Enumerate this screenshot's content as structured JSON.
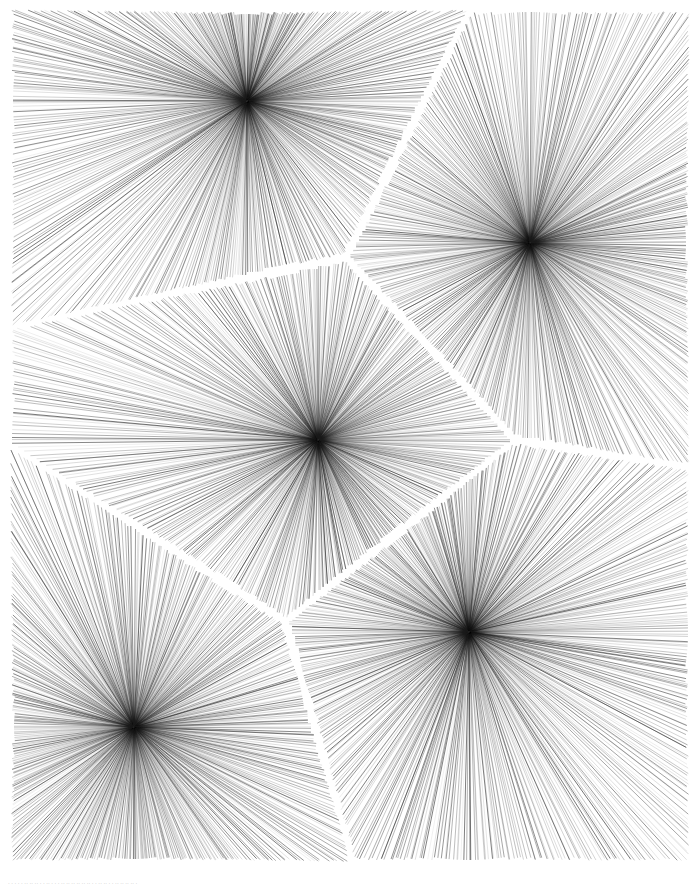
{
  "artwork": {
    "title": "Voronoi Radial Burst Field",
    "medium": "generative line drawing",
    "background_color": "#ffffff",
    "ink_color": "#1a1a1a",
    "margin_px": 9,
    "canvas": {
      "width": 700,
      "height": 872
    },
    "line_style": {
      "stroke_width": 0.45,
      "min_opacity": 0.18,
      "max_opacity": 0.95
    },
    "cells": [
      {
        "name": "cell-top-left",
        "center_x": 247,
        "center_y": 101,
        "rays": 520,
        "seed": 11
      },
      {
        "name": "cell-top-right",
        "center_x": 530,
        "center_y": 243,
        "rays": 520,
        "seed": 23
      },
      {
        "name": "cell-center",
        "center_x": 318,
        "center_y": 440,
        "rays": 520,
        "seed": 37
      },
      {
        "name": "cell-bottom-left",
        "center_x": 134,
        "center_y": 727,
        "rays": 520,
        "seed": 53
      },
      {
        "name": "cell-bottom-right",
        "center_x": 469,
        "center_y": 632,
        "rays": 520,
        "seed": 71
      }
    ],
    "cell_count": 5,
    "boundary_gap_px": 3
  },
  "caption": {
    "text": "· · ·   · ·   ·· ·· ·· ·  ·   ·· ·   ·  ·  ·· ··   ·· ··  ·· ··  ·   ·  ·· ··   ·  ·   ·· ·· ·· ·· ·",
    "visible": true,
    "color": "#b9b9b9"
  }
}
